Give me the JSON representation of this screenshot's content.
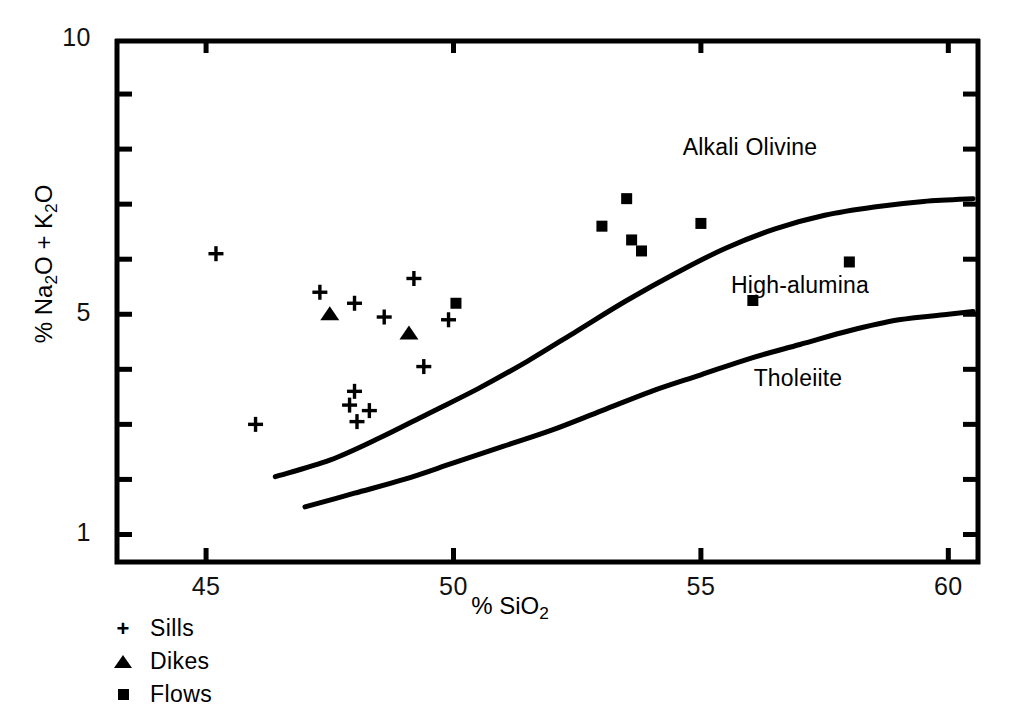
{
  "chart_data": {
    "type": "scatter",
    "title": "",
    "xlabel": "% SiO2",
    "ylabel": "% Na2O + K2O",
    "xlim": [
      43.2,
      60.6
    ],
    "ylim": [
      0.5,
      10
    ],
    "xticks": [
      45,
      50,
      55,
      60
    ],
    "xtick_labels": [
      "45",
      "50",
      "55",
      "60"
    ],
    "yticks": [
      1,
      2,
      3,
      4,
      5,
      6,
      7,
      8,
      9,
      10
    ],
    "ytick_labels": [
      "1",
      "",
      "",
      "",
      "5",
      "",
      "",
      "",
      "",
      "10"
    ],
    "grid": false,
    "legend_position": "below-left",
    "series": [
      {
        "name": "Sills",
        "marker": "plus",
        "points": [
          [
            45.2,
            6.1
          ],
          [
            46.0,
            3.0
          ],
          [
            47.3,
            5.4
          ],
          [
            47.9,
            3.35
          ],
          [
            48.0,
            3.6
          ],
          [
            48.05,
            3.05
          ],
          [
            48.0,
            5.2
          ],
          [
            48.3,
            3.25
          ],
          [
            48.6,
            4.95
          ],
          [
            49.2,
            5.65
          ],
          [
            49.4,
            4.05
          ],
          [
            49.9,
            4.9
          ]
        ]
      },
      {
        "name": "Dikes",
        "marker": "triangle",
        "points": [
          [
            47.5,
            5.0
          ],
          [
            49.1,
            4.65
          ]
        ]
      },
      {
        "name": "Flows",
        "marker": "square",
        "points": [
          [
            50.05,
            5.2
          ],
          [
            53.0,
            6.6
          ],
          [
            53.5,
            7.1
          ],
          [
            53.6,
            6.35
          ],
          [
            53.8,
            6.15
          ],
          [
            55.0,
            6.65
          ],
          [
            56.05,
            5.25
          ],
          [
            58.0,
            5.95
          ]
        ]
      }
    ],
    "boundary_curves": [
      {
        "name": "alkali-olivine-high-alumina-boundary",
        "points": [
          [
            46.4,
            2.05
          ],
          [
            47.5,
            2.35
          ],
          [
            48.5,
            2.75
          ],
          [
            49.5,
            3.2
          ],
          [
            50.5,
            3.65
          ],
          [
            51.5,
            4.15
          ],
          [
            52.5,
            4.7
          ],
          [
            53.5,
            5.25
          ],
          [
            54.5,
            5.75
          ],
          [
            55.5,
            6.2
          ],
          [
            56.5,
            6.55
          ],
          [
            57.5,
            6.8
          ],
          [
            58.5,
            6.95
          ],
          [
            59.5,
            7.05
          ],
          [
            60.5,
            7.1
          ]
        ]
      },
      {
        "name": "high-alumina-tholeiite-boundary",
        "points": [
          [
            47.0,
            1.5
          ],
          [
            48.0,
            1.75
          ],
          [
            49.0,
            2.0
          ],
          [
            50.0,
            2.3
          ],
          [
            51.0,
            2.6
          ],
          [
            52.0,
            2.9
          ],
          [
            53.0,
            3.25
          ],
          [
            54.0,
            3.6
          ],
          [
            55.0,
            3.9
          ],
          [
            56.0,
            4.2
          ],
          [
            57.0,
            4.45
          ],
          [
            58.0,
            4.7
          ],
          [
            59.0,
            4.9
          ],
          [
            60.0,
            5.0
          ],
          [
            60.5,
            5.05
          ]
        ]
      }
    ],
    "annotations": [
      {
        "text": "Alkali Olivine",
        "x_px": 750,
        "y_px": 134
      },
      {
        "text": "High-alumina",
        "x_px": 800,
        "y_px": 272
      },
      {
        "text": "Tholeiite",
        "x_px": 798,
        "y_px": 365
      }
    ]
  },
  "axes": {
    "y_label_parts": {
      "prefix": "% Na",
      "sub1": "2",
      "mid": "O + K",
      "sub2": "2",
      "suffix": "O"
    },
    "x_label_parts": {
      "prefix": "% SiO",
      "sub": "2"
    },
    "x_tick_labels": [
      "45",
      "50",
      "55",
      "60"
    ],
    "y_tick_labels": {
      "top": "10",
      "mid": "5",
      "bottom": "1"
    }
  },
  "legend": {
    "items": [
      {
        "label": "Sills",
        "glyph": "plus-icon"
      },
      {
        "label": "Dikes",
        "glyph": "triangle-icon"
      },
      {
        "label": "Flows",
        "glyph": "square-icon"
      }
    ]
  },
  "colors": {
    "ink": "#000000",
    "background": "#ffffff"
  }
}
